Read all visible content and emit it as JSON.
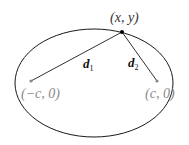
{
  "diagram": {
    "type": "ellipse-foci",
    "point_label": "(x, y)",
    "focus_left_label": "(−c, 0)",
    "focus_right_label": "(c, 0)",
    "d1_label": "d",
    "d1_sub": "1",
    "d2_label": "d",
    "d2_sub": "2",
    "colors": {
      "curve": "#1a1a1a",
      "focus_text": "#8a8a8a",
      "point": "#000000"
    }
  }
}
